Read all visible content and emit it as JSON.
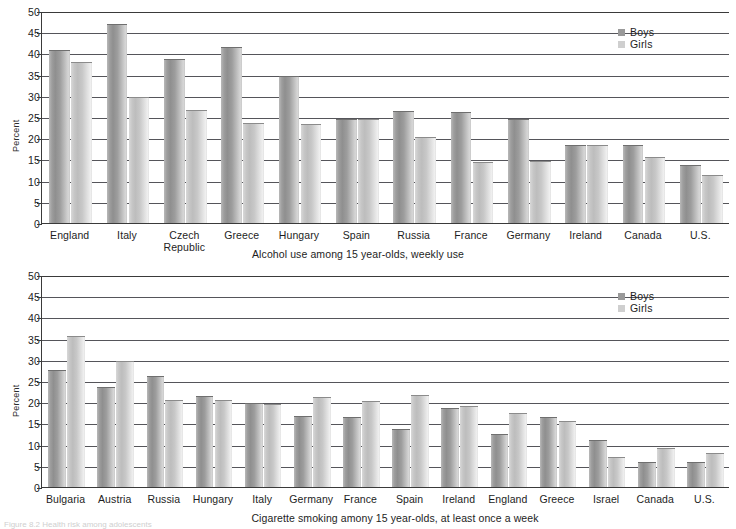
{
  "figure": {
    "footer_note": "Figure 8.2  Health risk among adolescents",
    "percent_axis_label": "Percent"
  },
  "legend": {
    "boys_label": "Boys",
    "girls_label": "Girls",
    "boys_color": "#9a9a9a",
    "girls_color": "#cfcfcf"
  },
  "chart_data": [
    {
      "type": "bar",
      "title": "",
      "caption": "Alcohol use among 15 year-olds, weekly use",
      "xlabel": "",
      "ylabel": "Percent",
      "ylim": [
        0,
        50
      ],
      "yticks": [
        0,
        5,
        10,
        15,
        20,
        25,
        30,
        35,
        40,
        45,
        50
      ],
      "grid": true,
      "legend_position": "top-right",
      "categories": [
        "England",
        "Italy",
        "Czech\nRepublic",
        "Greece",
        "Hungary",
        "Spain",
        "Russia",
        "France",
        "Germany",
        "Ireland",
        "Canada",
        "U.S."
      ],
      "series": [
        {
          "name": "Boys",
          "values": [
            40.8,
            47.0,
            38.8,
            41.5,
            34.7,
            24.5,
            26.4,
            26.3,
            24.5,
            18.3,
            18.3,
            13.6
          ]
        },
        {
          "name": "Girls",
          "values": [
            38.0,
            29.8,
            26.6,
            23.6,
            23.4,
            24.6,
            20.4,
            14.5,
            14.6,
            18.3,
            15.5,
            11.3
          ]
        }
      ]
    },
    {
      "type": "bar",
      "title": "",
      "caption": "Cigarette smoking amony 15 year-olds, at least once a week",
      "xlabel": "",
      "ylabel": "Percent",
      "ylim": [
        0,
        50
      ],
      "yticks": [
        0,
        5,
        10,
        15,
        20,
        25,
        30,
        35,
        40,
        45,
        50
      ],
      "grid": true,
      "legend_position": "top-right",
      "categories": [
        "Bulgaria",
        "Austria",
        "Russia",
        "Hungary",
        "Italy",
        "Germany",
        "France",
        "Spain",
        "Ireland",
        "England",
        "Greece",
        "Israel",
        "Canada",
        "U.S."
      ],
      "series": [
        {
          "name": "Boys",
          "values": [
            27.6,
            23.5,
            26.3,
            21.5,
            19.7,
            16.7,
            16.6,
            13.8,
            18.7,
            12.4,
            16.6,
            11.2,
            5.9,
            6.0
          ]
        },
        {
          "name": "Girls",
          "values": [
            35.6,
            29.7,
            20.5,
            20.5,
            19.6,
            21.3,
            20.3,
            21.8,
            19.0,
            17.5,
            15.6,
            7.0,
            9.1,
            8.0
          ]
        }
      ]
    }
  ]
}
